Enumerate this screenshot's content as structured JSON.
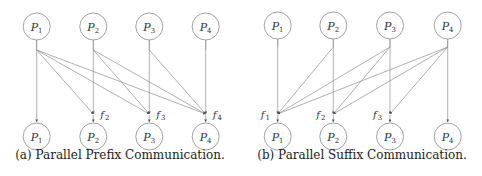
{
  "figure": {
    "panels": [
      {
        "id": "a",
        "caption": "(a) Parallel Prefix Communication.",
        "top_nodes": [
          {
            "label": "P",
            "sub": "1"
          },
          {
            "label": "P",
            "sub": "2"
          },
          {
            "label": "P",
            "sub": "3"
          },
          {
            "label": "P",
            "sub": "4"
          }
        ],
        "bottom_nodes": [
          {
            "label": "P",
            "sub": "1"
          },
          {
            "label": "P",
            "sub": "2"
          },
          {
            "label": "P",
            "sub": "3"
          },
          {
            "label": "P",
            "sub": "4"
          }
        ],
        "functions": [
          {
            "label": "f",
            "sub": "2",
            "column": 2
          },
          {
            "label": "f",
            "sub": "3",
            "column": 3
          },
          {
            "label": "f",
            "sub": "4",
            "column": 4
          }
        ],
        "edges": [
          {
            "from": 1,
            "to": 1
          },
          {
            "from": 1,
            "to": 2
          },
          {
            "from": 1,
            "to": 3
          },
          {
            "from": 1,
            "to": 4
          },
          {
            "from": 2,
            "to": 2
          },
          {
            "from": 2,
            "to": 3
          },
          {
            "from": 2,
            "to": 4
          },
          {
            "from": 3,
            "to": 3
          },
          {
            "from": 3,
            "to": 4
          },
          {
            "from": 4,
            "to": 4
          }
        ]
      },
      {
        "id": "b",
        "caption": "(b) Parallel Suffix Communication.",
        "top_nodes": [
          {
            "label": "P",
            "sub": "1"
          },
          {
            "label": "P",
            "sub": "2"
          },
          {
            "label": "P",
            "sub": "3"
          },
          {
            "label": "P",
            "sub": "4"
          }
        ],
        "bottom_nodes": [
          {
            "label": "P",
            "sub": "1"
          },
          {
            "label": "P",
            "sub": "2"
          },
          {
            "label": "P",
            "sub": "3"
          },
          {
            "label": "P",
            "sub": "4"
          }
        ],
        "functions": [
          {
            "label": "f",
            "sub": "1",
            "column": 1
          },
          {
            "label": "f",
            "sub": "2",
            "column": 2
          },
          {
            "label": "f",
            "sub": "3",
            "column": 3
          }
        ],
        "edges": [
          {
            "from": 1,
            "to": 1
          },
          {
            "from": 2,
            "to": 1
          },
          {
            "from": 2,
            "to": 2
          },
          {
            "from": 3,
            "to": 1
          },
          {
            "from": 3,
            "to": 2
          },
          {
            "from": 3,
            "to": 3
          },
          {
            "from": 4,
            "to": 1
          },
          {
            "from": 4,
            "to": 2
          },
          {
            "from": 4,
            "to": 3
          },
          {
            "from": 4,
            "to": 4
          }
        ]
      }
    ]
  }
}
